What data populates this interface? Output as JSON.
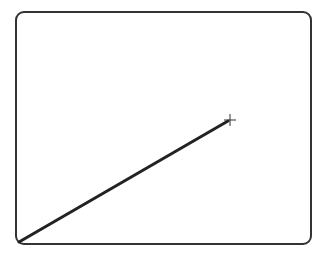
{
  "canvas": {
    "width": 326,
    "height": 257,
    "background": "#ffffff"
  },
  "frame": {
    "x": 16,
    "y": 12,
    "width": 295,
    "height": 232,
    "radius": 8,
    "stroke": "#333333",
    "stroke_width": 2
  },
  "line": {
    "x1": 19,
    "y1": 242,
    "x2": 228,
    "y2": 121,
    "stroke": "#222222",
    "stroke_width": 3
  },
  "cursor": {
    "type": "crosshair",
    "x": 230,
    "y": 120,
    "size": 6,
    "stroke": "#333333"
  }
}
